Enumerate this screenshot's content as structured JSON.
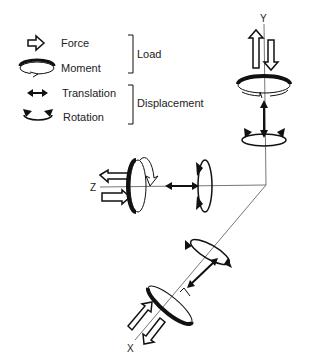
{
  "legend": {
    "items": [
      {
        "icon": "force-arrow-icon",
        "label": "Force"
      },
      {
        "icon": "moment-icon",
        "label": "Moment"
      },
      {
        "icon": "translation-icon",
        "label": "Translation"
      },
      {
        "icon": "rotation-icon",
        "label": "Rotation"
      }
    ],
    "groups": [
      {
        "label": "Load"
      },
      {
        "label": "Displacement"
      }
    ]
  },
  "axes": {
    "y": "Y",
    "z": "Z",
    "x": "X"
  },
  "colors": {
    "stroke": "#111111",
    "axis": "#777777",
    "background": "#ffffff"
  }
}
